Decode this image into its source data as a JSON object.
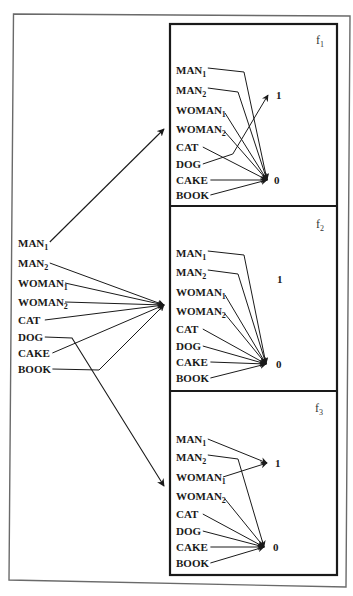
{
  "diagram": {
    "inputs": [
      {
        "id": "MAN1",
        "base": "MAN",
        "sub": "1"
      },
      {
        "id": "MAN2",
        "base": "MAN",
        "sub": "2"
      },
      {
        "id": "WOMAN1",
        "base": "WOMAN",
        "sub": "1"
      },
      {
        "id": "WOMAN2",
        "base": "WOMAN",
        "sub": "2"
      },
      {
        "id": "CAT",
        "base": "CAT",
        "sub": ""
      },
      {
        "id": "DOG",
        "base": "DOG",
        "sub": ""
      },
      {
        "id": "CAKE",
        "base": "CAKE",
        "sub": ""
      },
      {
        "id": "BOOK",
        "base": "BOOK",
        "sub": ""
      }
    ],
    "left_panel": {
      "routing": {
        "MAN1": "f1",
        "MAN2": "f2",
        "WOMAN1": "f2",
        "WOMAN2": "f2",
        "CAT": "f2",
        "DOG": "f3",
        "CAKE": "f2",
        "BOOK": "f2"
      }
    },
    "functions": [
      {
        "name": "f",
        "sub": "1",
        "output_one": "1",
        "output_zero": "0",
        "mapping": {
          "MAN1": "0",
          "MAN2": "0",
          "WOMAN1": "0",
          "WOMAN2": "0",
          "CAT": "0",
          "DOG": "1",
          "CAKE": "0",
          "BOOK": "0"
        }
      },
      {
        "name": "f",
        "sub": "2",
        "output_one": "1",
        "output_zero": "0",
        "mapping": {
          "MAN1": "0",
          "MAN2": "0",
          "WOMAN1": "0",
          "WOMAN2": "0",
          "CAT": "0",
          "DOG": "0",
          "CAKE": "0",
          "BOOK": "0"
        }
      },
      {
        "name": "f",
        "sub": "3",
        "output_one": "1",
        "output_zero": "0",
        "mapping": {
          "MAN1": "1",
          "MAN2": "0",
          "WOMAN1": "1",
          "WOMAN2": "0",
          "CAT": "0",
          "DOG": "0",
          "CAKE": "0",
          "BOOK": "0"
        }
      }
    ]
  }
}
